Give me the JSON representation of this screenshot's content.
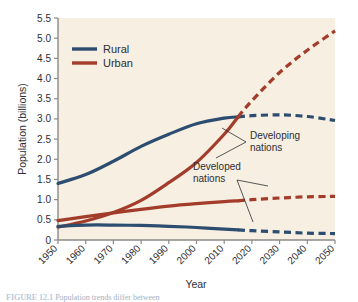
{
  "figure": {
    "caption_prefix": "FIGURE 12.1",
    "caption_text": "Population trends differ between"
  },
  "chart_data": {
    "type": "line",
    "title": "",
    "xlabel": "Year",
    "ylabel": "Population (billions)",
    "xlim": [
      1950,
      2050
    ],
    "ylim": [
      0,
      5.5
    ],
    "grid": false,
    "legend_position": "upper-left",
    "projection_start_year": 2015,
    "x": [
      1950,
      1960,
      1970,
      1980,
      1990,
      2000,
      2010,
      2015,
      2020,
      2030,
      2040,
      2050
    ],
    "xticks": [
      "1950",
      "1960",
      "1970",
      "1980",
      "1990",
      "2000",
      "2010",
      "2020",
      "2030",
      "2040",
      "2050"
    ],
    "yticks": [
      "0",
      "0.5",
      "1.0",
      "1.5",
      "2.0",
      "2.5",
      "3.0",
      "3.5",
      "4.0",
      "4.5",
      "5.0",
      "5.5"
    ],
    "series": [
      {
        "name": "Rural — Developing nations",
        "category": "Rural",
        "region": "Developing nations",
        "color": "#2d4d70",
        "values": [
          1.4,
          1.62,
          1.95,
          2.32,
          2.62,
          2.88,
          3.02,
          3.05,
          3.08,
          3.1,
          3.06,
          2.96
        ]
      },
      {
        "name": "Urban — Developing nations",
        "category": "Urban",
        "region": "Developing nations",
        "color": "#a33c2a",
        "values": [
          0.32,
          0.47,
          0.68,
          0.98,
          1.42,
          1.92,
          2.62,
          3.05,
          3.45,
          4.15,
          4.7,
          5.18
        ]
      },
      {
        "name": "Urban — Developed nations",
        "category": "Urban",
        "region": "Developed nations",
        "color": "#a33c2a",
        "values": [
          0.48,
          0.58,
          0.67,
          0.76,
          0.84,
          0.9,
          0.95,
          0.97,
          1.0,
          1.04,
          1.07,
          1.08
        ]
      },
      {
        "name": "Rural — Developed nations",
        "category": "Rural",
        "region": "Developed nations",
        "color": "#2d4d70",
        "values": [
          0.34,
          0.37,
          0.37,
          0.36,
          0.34,
          0.31,
          0.27,
          0.25,
          0.23,
          0.2,
          0.17,
          0.16
        ]
      }
    ],
    "legend": [
      {
        "label": "Rural",
        "color": "#2d4d70"
      },
      {
        "label": "Urban",
        "color": "#a33c2a"
      }
    ],
    "annotations": [
      {
        "label_line1": "Developing",
        "label_line2": "nations"
      },
      {
        "label_line1": "Developed",
        "label_line2": "nations"
      }
    ]
  },
  "colors": {
    "plot_background": "#f6efe2",
    "rural": "#2d4d70",
    "urban": "#a33c2a",
    "axis": "#8d8a86",
    "text": "#2e2e32"
  }
}
